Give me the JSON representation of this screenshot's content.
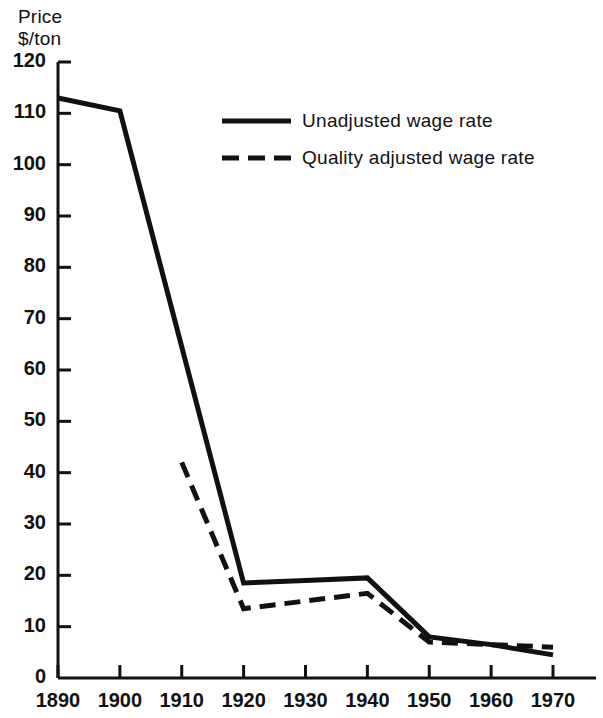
{
  "chart_data": {
    "type": "line",
    "title": "",
    "ylabel": "Price\n$/ton",
    "xlabel": "",
    "ylim": [
      0,
      120
    ],
    "xlim": [
      1890,
      1970
    ],
    "yticks": [
      0,
      10,
      20,
      30,
      40,
      50,
      60,
      70,
      80,
      90,
      100,
      110,
      120
    ],
    "xticks": [
      1890,
      1900,
      1910,
      1920,
      1930,
      1940,
      1950,
      1960,
      1970
    ],
    "ytick_labels": [
      "0",
      "10",
      "20",
      "30",
      "40",
      "50",
      "60",
      "70",
      "80",
      "90",
      "100",
      "110",
      "120"
    ],
    "xtick_labels": [
      "1890",
      "1900",
      "1910",
      "1920",
      "1930",
      "1940",
      "1950",
      "1960",
      "1970"
    ],
    "grid": false,
    "legend_position": "upper-center",
    "line_color": "#111111",
    "series": [
      {
        "name": "Unadjusted wage rate",
        "style": "solid",
        "x": [
          1890,
          1900,
          1920,
          1930,
          1940,
          1950,
          1960,
          1970
        ],
        "values": [
          113,
          110.5,
          18.5,
          19,
          19.5,
          8,
          6.5,
          4.5
        ]
      },
      {
        "name": "Quality adjusted wage rate",
        "style": "dashed",
        "x": [
          1910,
          1920,
          1930,
          1940,
          1950,
          1960,
          1970
        ],
        "values": [
          42,
          13.5,
          15,
          16.5,
          7,
          6.5,
          6
        ]
      }
    ]
  },
  "legend": {
    "items": [
      {
        "label": "Unadjusted wage rate",
        "style": "solid"
      },
      {
        "label": "Quality adjusted wage rate",
        "style": "dashed"
      }
    ]
  }
}
